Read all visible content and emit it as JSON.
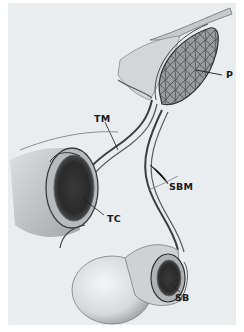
{
  "figure": {
    "type": "anatomical illustration",
    "background_color": "#e9edef",
    "ink_color": "#1a1a1a",
    "labels": [
      {
        "id": "P",
        "text": "P",
        "x": 226,
        "y": 72
      },
      {
        "id": "TM",
        "text": "TM",
        "x": 96,
        "y": 116
      },
      {
        "id": "SBM",
        "text": "SBM",
        "x": 169,
        "y": 184
      },
      {
        "id": "TC",
        "text": "TC",
        "x": 107,
        "y": 215
      },
      {
        "id": "SB",
        "text": "SB",
        "x": 175,
        "y": 295
      }
    ]
  }
}
